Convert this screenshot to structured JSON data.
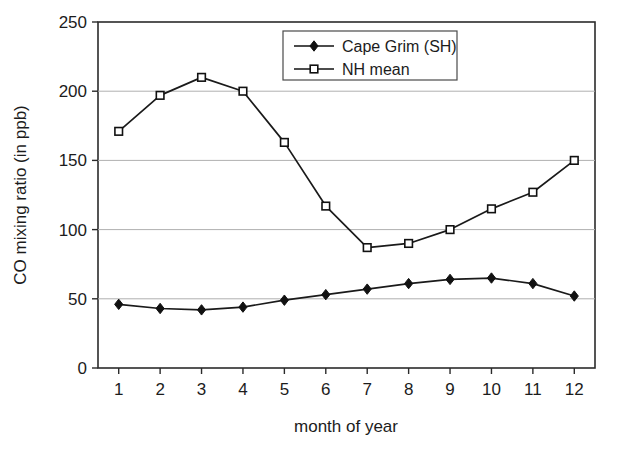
{
  "chart_data": {
    "type": "line",
    "title": "",
    "xlabel": "month of year",
    "ylabel": "CO mixing ratio (in ppb)",
    "x": [
      1,
      2,
      3,
      4,
      5,
      6,
      7,
      8,
      9,
      10,
      11,
      12
    ],
    "categories": [
      "1",
      "2",
      "3",
      "4",
      "5",
      "6",
      "7",
      "8",
      "9",
      "10",
      "11",
      "12"
    ],
    "xtick_labels": [
      "1",
      "2",
      "3",
      "4",
      "5",
      "6",
      "7",
      "8",
      "9",
      "10",
      "11",
      "12"
    ],
    "ytick_labels": [
      "0",
      "50",
      "100",
      "150",
      "200",
      "250"
    ],
    "ytick_values": [
      0,
      50,
      100,
      150,
      200,
      250
    ],
    "xlim": [
      0.5,
      12.5
    ],
    "ylim": [
      0,
      250
    ],
    "grid": "horizontal",
    "grid_color": "#b0b0b0",
    "legend_position": "top-center-right",
    "series": [
      {
        "name": "Cape Grim (SH)",
        "marker": "filled-diamond",
        "color": "#1a1a1a",
        "values": [
          46,
          43,
          42,
          44,
          49,
          53,
          57,
          61,
          64,
          65,
          61,
          52
        ]
      },
      {
        "name": "NH mean",
        "marker": "open-square",
        "color": "#1a1a1a",
        "values": [
          171,
          197,
          210,
          200,
          163,
          117,
          87,
          90,
          100,
          115,
          127,
          150
        ]
      }
    ]
  },
  "legend": {
    "entries": [
      {
        "label": "Cape Grim (SH)",
        "marker": "filled-diamond"
      },
      {
        "label": "NH mean",
        "marker": "open-square"
      }
    ]
  }
}
